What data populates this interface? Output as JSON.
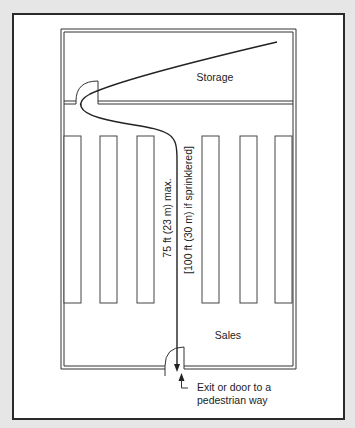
{
  "diagram": {
    "rooms": [
      {
        "name": "storage",
        "label": "Storage"
      },
      {
        "name": "sales",
        "label": "Sales"
      }
    ],
    "rack_count": 6,
    "travel_distance": {
      "max_label": "75 ft (23 m) max.",
      "sprinklered_label": "[100 ft (30 m) if sprinklered]"
    },
    "exit": {
      "label_line1": "Exit or door to a",
      "label_line2": "pedestrian way"
    },
    "colors": {
      "background": "#e6e6e6",
      "frame_border": "#2a2a2a",
      "line": "#333333",
      "paper": "#ffffff"
    }
  }
}
